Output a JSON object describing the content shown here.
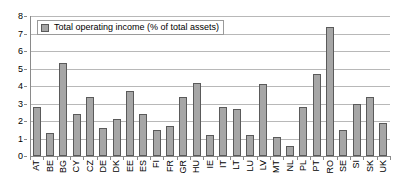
{
  "chart_data": {
    "type": "bar",
    "title": "",
    "xlabel": "",
    "ylabel": "",
    "ylim": [
      0,
      8
    ],
    "yticks": [
      0,
      1,
      2,
      3,
      4,
      5,
      6,
      7,
      8
    ],
    "grid": true,
    "legend_position": "top-left",
    "series_name": "Total operating income (% of total assets)",
    "bar_color": "#a6a6a6",
    "bar_edge_color": "#5a5a5a",
    "gridline_color": "#b8b8b8",
    "axis_color": "#8a8a8a",
    "categories": [
      "AT",
      "BE",
      "BG",
      "CY",
      "CZ",
      "DE",
      "DK",
      "EE",
      "ES",
      "FI",
      "FR",
      "GR",
      "HU",
      "IE",
      "IT",
      "LT",
      "LU",
      "LV",
      "MT",
      "NL",
      "PL",
      "PT",
      "RO",
      "SE",
      "SI",
      "SK",
      "UK"
    ],
    "values": [
      2.8,
      1.3,
      5.3,
      2.4,
      3.4,
      1.6,
      2.1,
      3.7,
      2.4,
      1.5,
      1.7,
      3.4,
      4.2,
      1.2,
      2.8,
      2.7,
      1.2,
      4.1,
      1.1,
      0.6,
      2.8,
      4.7,
      7.4,
      1.5,
      3.0,
      3.4,
      1.9
    ],
    "legend": [
      {
        "label": "Total operating income (% of total assets)",
        "color": "#a6a6a6"
      }
    ]
  }
}
